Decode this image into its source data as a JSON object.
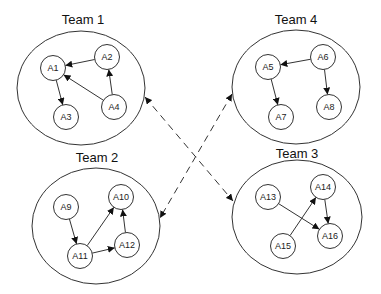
{
  "diagram": {
    "title": "",
    "teams": [
      {
        "id": "team1",
        "label": "Team 1",
        "cx": 81,
        "cy": 88,
        "rx": 64,
        "ry": 57,
        "label_x": 83,
        "label_y": 24,
        "agents": [
          {
            "id": "A1",
            "label": "A1",
            "x": 53,
            "y": 68
          },
          {
            "id": "A2",
            "label": "A2",
            "x": 107,
            "y": 57
          },
          {
            "id": "A3",
            "label": "A3",
            "x": 66,
            "y": 117
          },
          {
            "id": "A4",
            "label": "A4",
            "x": 114,
            "y": 107
          }
        ]
      },
      {
        "id": "team4",
        "label": "Team 4",
        "cx": 296,
        "cy": 87,
        "rx": 64,
        "ry": 57,
        "label_x": 296,
        "label_y": 24,
        "agents": [
          {
            "id": "A5",
            "label": "A5",
            "x": 268,
            "y": 67
          },
          {
            "id": "A6",
            "label": "A6",
            "x": 323,
            "y": 57
          },
          {
            "id": "A7",
            "label": "A7",
            "x": 281,
            "y": 117
          },
          {
            "id": "A8",
            "label": "A8",
            "x": 329,
            "y": 107
          }
        ]
      },
      {
        "id": "team2",
        "label": "Team 2",
        "cx": 96,
        "cy": 226,
        "rx": 64,
        "ry": 58,
        "label_x": 97,
        "label_y": 162,
        "agents": [
          {
            "id": "A9",
            "label": "A9",
            "x": 66,
            "y": 207
          },
          {
            "id": "A10",
            "label": "A10",
            "x": 121,
            "y": 197
          },
          {
            "id": "A11",
            "label": "A11",
            "x": 80,
            "y": 256
          },
          {
            "id": "A12",
            "label": "A12",
            "x": 127,
            "y": 245
          }
        ]
      },
      {
        "id": "team3",
        "label": "Team 3",
        "cx": 297,
        "cy": 217,
        "rx": 65,
        "ry": 57,
        "label_x": 297,
        "label_y": 158,
        "agents": [
          {
            "id": "A13",
            "label": "A13",
            "x": 268,
            "y": 197
          },
          {
            "id": "A14",
            "label": "A14",
            "x": 323,
            "y": 187
          },
          {
            "id": "A15",
            "label": "A15",
            "x": 283,
            "y": 246
          },
          {
            "id": "A16",
            "label": "A16",
            "x": 330,
            "y": 236
          }
        ]
      }
    ],
    "agent_radius": 12.5,
    "edges": [
      {
        "from": "A2",
        "to": "A1"
      },
      {
        "from": "A4",
        "to": "A1"
      },
      {
        "from": "A4",
        "to": "A2"
      },
      {
        "from": "A1",
        "to": "A3"
      },
      {
        "from": "A6",
        "to": "A5"
      },
      {
        "from": "A6",
        "to": "A8"
      },
      {
        "from": "A5",
        "to": "A7"
      },
      {
        "from": "A9",
        "to": "A11"
      },
      {
        "from": "A11",
        "to": "A10"
      },
      {
        "from": "A11",
        "to": "A12"
      },
      {
        "from": "A12",
        "to": "A10"
      },
      {
        "from": "A13",
        "to": "A16"
      },
      {
        "from": "A15",
        "to": "A14"
      },
      {
        "from": "A14",
        "to": "A16"
      }
    ],
    "team_links": [
      {
        "from": "Team 1",
        "to": "Team 3",
        "style": "dashed",
        "bidirectional": true,
        "x1": 145,
        "y1": 97,
        "x2": 233,
        "y2": 201
      },
      {
        "from": "Team 4",
        "to": "Team 2",
        "style": "dashed",
        "bidirectional": true,
        "x1": 232,
        "y1": 94,
        "x2": 160,
        "y2": 218
      }
    ],
    "colors": {
      "stroke": "#333333",
      "background": "#ffffff",
      "text": "#222222"
    }
  }
}
